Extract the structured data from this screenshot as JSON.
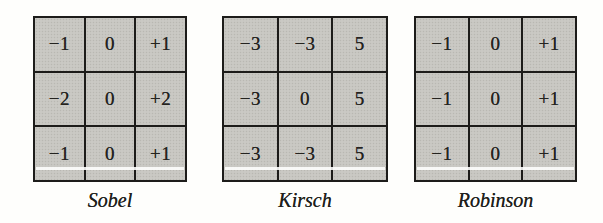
{
  "figure": {
    "description_colors": {
      "cell_fill": "#c7c6c1",
      "grid_line": "#1d1c1a",
      "text": "#24231f",
      "background": "#fefefc",
      "scan_streak": "#fffffe"
    }
  },
  "kernels": [
    {
      "label": "Sobel",
      "rows": [
        [
          "−1",
          "0",
          "+1"
        ],
        [
          "−2",
          "0",
          "+2"
        ],
        [
          "−1",
          "0",
          "+1"
        ]
      ]
    },
    {
      "label": "Kirsch",
      "rows": [
        [
          "−3",
          "−3",
          "5"
        ],
        [
          "−3",
          "0",
          "5"
        ],
        [
          "−3",
          "−3",
          "5"
        ]
      ]
    },
    {
      "label": "Robinson",
      "rows": [
        [
          "−1",
          "0",
          "+1"
        ],
        [
          "−1",
          "0",
          "+1"
        ],
        [
          "−1",
          "0",
          "+1"
        ]
      ]
    }
  ]
}
